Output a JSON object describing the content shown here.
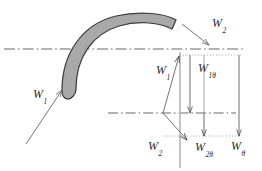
{
  "figure": {
    "colors": {
      "blade_fill": "#a9a9a9",
      "blade_outline": "#3d3d3d",
      "axis_line": "#555555",
      "vector_line": "#6b6b6b",
      "dotted_guide": "#8c8c8c",
      "label_text": "#2b2b2b",
      "background": "#ffffff"
    },
    "labels": [
      {
        "name": "w2-outlet-velocity",
        "base": "W",
        "sub": "2",
        "x": 212,
        "y": 17
      },
      {
        "name": "w1-inlet-velocity",
        "base": "W",
        "sub": "1",
        "x": 33,
        "y": 88
      },
      {
        "name": "w1-vector",
        "base": "W",
        "sub": "1",
        "x": 156,
        "y": 64
      },
      {
        "name": "w1theta-tangential",
        "base": "W",
        "sub": "1θ",
        "x": 198,
        "y": 62
      },
      {
        "name": "w2-vector",
        "base": "W",
        "sub": "2",
        "x": 148,
        "y": 140
      },
      {
        "name": "w2theta-tangential",
        "base": "W",
        "sub": "2θ",
        "x": 195,
        "y": 141
      },
      {
        "name": "wtheta-total-tangential",
        "base": "W",
        "sub": "θ",
        "x": 231,
        "y": 140
      }
    ],
    "geometry": {
      "upper_axis_y": 49,
      "lower_axis_y": 113,
      "vector_origin": {
        "x": 163,
        "y": 113
      },
      "axial_line_x": 180,
      "w1theta_line_x": 204,
      "wtheta_line_x": 239,
      "w1_tip": {
        "x": 178,
        "y": 56
      },
      "w2_tip": {
        "x": 186,
        "y": 141
      }
    }
  }
}
